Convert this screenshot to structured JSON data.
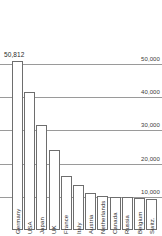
{
  "chart_data": {
    "type": "bar",
    "title": "",
    "xlabel": "",
    "ylabel": "",
    "categories": [
      "Germany",
      "USA",
      "Japan",
      "UK",
      "France",
      "Italy",
      "Austria",
      "Netherlands",
      "Canada",
      "Russia",
      "Belgium",
      "Switz."
    ],
    "values": [
      50812,
      41500,
      31700,
      24000,
      16200,
      13600,
      11200,
      10200,
      10000,
      9800,
      9500,
      9200
    ],
    "ylim": [
      0,
      56000
    ],
    "grid": true,
    "gridlines": [
      {
        "value": 50000,
        "label": "50,000"
      },
      {
        "value": 40000,
        "label": "40,000"
      },
      {
        "value": 30000,
        "label": "30,000"
      },
      {
        "value": 20000,
        "label": "20,000"
      },
      {
        "value": 10000,
        "label": "10,000"
      }
    ],
    "data_labels": [
      {
        "category": "Germany",
        "label": "50,812"
      }
    ],
    "legend": [],
    "legend_position": "none",
    "bar_fill": "#ffffff",
    "bar_stroke": "#6e6e6e",
    "grid_color": "#9a9a9a",
    "text_color": "#2a2a2a"
  }
}
